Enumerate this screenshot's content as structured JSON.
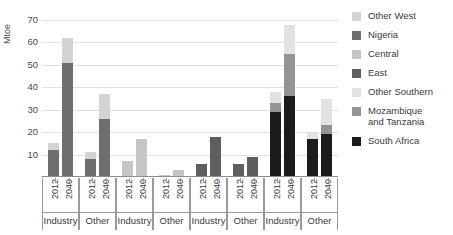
{
  "chart_data": {
    "type": "bar",
    "stacked": true,
    "title": "",
    "xlabel": "",
    "ylabel": "Mtoe",
    "ylim": [
      0,
      70
    ],
    "yticks": [
      0,
      10,
      20,
      30,
      40,
      50,
      60,
      70
    ],
    "grid": true,
    "legend_position": "right",
    "legend": [
      "Other West",
      "Nigeria",
      "Central",
      "East",
      "Other Southern",
      "Mozambique and Tanzania",
      "South Africa"
    ],
    "colors": {
      "Other West": "#d4d4d4",
      "Nigeria": "#6e6e6e",
      "Central": "#c6c6c6",
      "East": "#5f5f5f",
      "Other Southern": "#e2e2e2",
      "Mozambique and Tanzania": "#949494",
      "South Africa": "#1c1c1c"
    },
    "groups": [
      {
        "region": "West",
        "sectors": [
          {
            "sector": "Industry",
            "bars": [
              {
                "year": "2012",
                "total": 15,
                "segments": [
                  {
                    "name": "Nigeria",
                    "value": 12
                  },
                  {
                    "name": "Other West",
                    "value": 3
                  }
                ]
              },
              {
                "year": "2040",
                "total": 62,
                "segments": [
                  {
                    "name": "Nigeria",
                    "value": 51
                  },
                  {
                    "name": "Other West",
                    "value": 11
                  }
                ]
              }
            ]
          },
          {
            "sector": "Other",
            "bars": [
              {
                "year": "2012",
                "total": 11,
                "segments": [
                  {
                    "name": "Nigeria",
                    "value": 8
                  },
                  {
                    "name": "Other West",
                    "value": 3
                  }
                ]
              },
              {
                "year": "2040",
                "total": 37,
                "segments": [
                  {
                    "name": "Nigeria",
                    "value": 26
                  },
                  {
                    "name": "Other West",
                    "value": 11
                  }
                ]
              }
            ]
          }
        ]
      },
      {
        "region": "Central",
        "sectors": [
          {
            "sector": "Industry",
            "bars": [
              {
                "year": "2012",
                "total": 7,
                "segments": [
                  {
                    "name": "Central",
                    "value": 7
                  }
                ]
              },
              {
                "year": "2040",
                "total": 17,
                "segments": [
                  {
                    "name": "Central",
                    "value": 17
                  }
                ]
              }
            ]
          },
          {
            "sector": "Other",
            "bars": [
              {
                "year": "2012",
                "total": 1,
                "segments": [
                  {
                    "name": "Central",
                    "value": 1
                  }
                ]
              },
              {
                "year": "2040",
                "total": 3,
                "segments": [
                  {
                    "name": "Central",
                    "value": 3
                  }
                ]
              }
            ]
          }
        ]
      },
      {
        "region": "East",
        "sectors": [
          {
            "sector": "Industry",
            "bars": [
              {
                "year": "2012",
                "total": 6,
                "segments": [
                  {
                    "name": "East",
                    "value": 6
                  }
                ]
              },
              {
                "year": "2040",
                "total": 18,
                "segments": [
                  {
                    "name": "East",
                    "value": 18
                  }
                ]
              }
            ]
          },
          {
            "sector": "Other",
            "bars": [
              {
                "year": "2012",
                "total": 6,
                "segments": [
                  {
                    "name": "East",
                    "value": 6
                  }
                ]
              },
              {
                "year": "2040",
                "total": 9,
                "segments": [
                  {
                    "name": "East",
                    "value": 9
                  }
                ]
              }
            ]
          }
        ]
      },
      {
        "region": "Southern",
        "sectors": [
          {
            "sector": "Industry",
            "bars": [
              {
                "year": "2012",
                "total": 38,
                "segments": [
                  {
                    "name": "South Africa",
                    "value": 29
                  },
                  {
                    "name": "Mozambique and Tanzania",
                    "value": 4
                  },
                  {
                    "name": "Other Southern",
                    "value": 5
                  }
                ]
              },
              {
                "year": "2040",
                "total": 68,
                "segments": [
                  {
                    "name": "South Africa",
                    "value": 36
                  },
                  {
                    "name": "Mozambique and Tanzania",
                    "value": 19
                  },
                  {
                    "name": "Other Southern",
                    "value": 13
                  }
                ]
              }
            ]
          },
          {
            "sector": "Other",
            "bars": [
              {
                "year": "2012",
                "total": 20,
                "segments": [
                  {
                    "name": "South Africa",
                    "value": 17
                  },
                  {
                    "name": "Other Southern",
                    "value": 3
                  }
                ]
              },
              {
                "year": "2040",
                "total": 35,
                "segments": [
                  {
                    "name": "South Africa",
                    "value": 19
                  },
                  {
                    "name": "Mozambique and Tanzania",
                    "value": 4
                  },
                  {
                    "name": "Other Southern",
                    "value": 12
                  }
                ]
              }
            ]
          }
        ]
      }
    ]
  }
}
